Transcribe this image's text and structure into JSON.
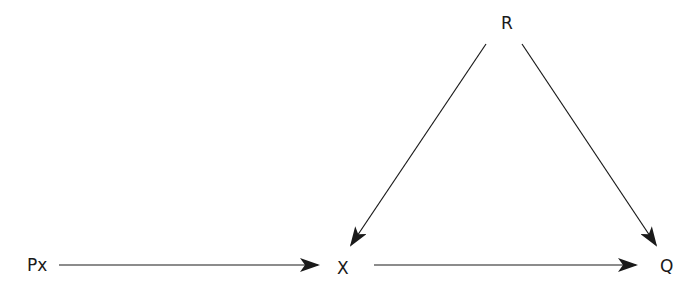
{
  "diagram": {
    "type": "causal-graph",
    "nodes": [
      {
        "id": "R",
        "label": "R"
      },
      {
        "id": "Px",
        "label": "Px"
      },
      {
        "id": "X",
        "label": "X"
      },
      {
        "id": "Q",
        "label": "Q"
      }
    ],
    "edges": [
      {
        "from": "Px",
        "to": "X"
      },
      {
        "from": "X",
        "to": "Q"
      },
      {
        "from": "R",
        "to": "X"
      },
      {
        "from": "R",
        "to": "Q"
      }
    ],
    "colors": {
      "line": "#1a1a1a",
      "background": "#ffffff"
    }
  }
}
